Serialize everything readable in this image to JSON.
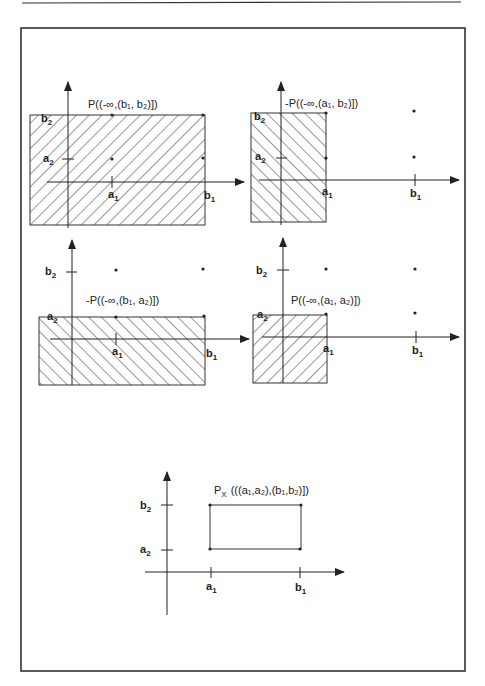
{
  "figure": {
    "panels": [
      {
        "id": "panel-1",
        "title": "P((-∞,(b₁, b₂)])",
        "region": "(-∞, b1] x (-∞, b2]",
        "hatch": "forward",
        "labels": {
          "y_top": "b",
          "y_top_sub": "2",
          "y_mid": "a",
          "y_mid_sub": "2",
          "x_mid": "a",
          "x_mid_sub": "1",
          "x_right": "b",
          "x_right_sub": "1"
        }
      },
      {
        "id": "panel-2",
        "title": "-P((-∞,(a₁, b₂)])",
        "region": "(-∞, a1] x (-∞, b2]",
        "hatch": "backward",
        "labels": {
          "y_top": "b",
          "y_top_sub": "2",
          "y_mid": "a",
          "y_mid_sub": "2",
          "x_mid": "a",
          "x_mid_sub": "1",
          "x_right": "b",
          "x_right_sub": "1"
        }
      },
      {
        "id": "panel-3",
        "title": "-P((-∞,(b₁, a₂)])",
        "region": "(-∞, b1] x (-∞, a2]",
        "hatch": "backward",
        "labels": {
          "y_top": "b",
          "y_top_sub": "2",
          "y_mid": "a",
          "y_mid_sub": "2",
          "x_mid": "a",
          "x_mid_sub": "1",
          "x_right": "b",
          "x_right_sub": "1"
        }
      },
      {
        "id": "panel-4",
        "title": "P((-∞,(a₁, a₂)])",
        "region": "(-∞, a1] x (-∞, a2]",
        "hatch": "forward",
        "labels": {
          "y_top": "b",
          "y_top_sub": "2",
          "y_mid": "a",
          "y_mid_sub": "2",
          "x_mid": "a",
          "x_mid_sub": "1",
          "x_right": "b",
          "x_right_sub": "1"
        }
      },
      {
        "id": "panel-5",
        "title_main": "P",
        "title_sub": "X",
        "title_rest": "(((a₁,a₂),(b₁,b₂)])",
        "region": "(a1, b1] x (a2, b2]",
        "hatch": "none",
        "labels": {
          "y_top": "b",
          "y_top_sub": "2",
          "y_mid": "a",
          "y_mid_sub": "2",
          "x_mid": "a",
          "x_mid_sub": "1",
          "x_right": "b",
          "x_right_sub": "1"
        }
      }
    ]
  }
}
